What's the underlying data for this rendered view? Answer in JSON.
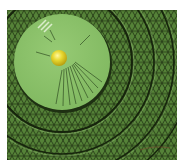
{
  "image": {
    "description": "3D rendered scene: a light green circular disc with a yellow sphere resting on it, over a dark green triangulated mesh surface with concentric ring grooves",
    "background": "#ffffff",
    "frame": {
      "x": 7,
      "y": 10,
      "width": 170,
      "height": 150
    },
    "colors": {
      "mesh_fill": "#5a8a3c",
      "mesh_lines": "#1e3012",
      "disc_fill": "#8cc26a",
      "disc_edge": "#2a4a1a",
      "sphere": "#e8d830",
      "sphere_highlight": "#fff8a0",
      "sphere_shadow": "#b8a010",
      "streak": "#2e4a20",
      "specular": "#e8f5dc"
    },
    "disc": {
      "cx": 62,
      "cy": 62,
      "r": 48
    },
    "sphere": {
      "cx": 59,
      "cy": 58,
      "r": 8
    },
    "rings": [
      {
        "cx": 62,
        "cy": 62,
        "r": 70
      },
      {
        "cx": 62,
        "cy": 62,
        "r": 92
      },
      {
        "cx": 62,
        "cy": 62,
        "r": 112
      },
      {
        "cx": 62,
        "cy": 62,
        "r": 130
      }
    ]
  }
}
